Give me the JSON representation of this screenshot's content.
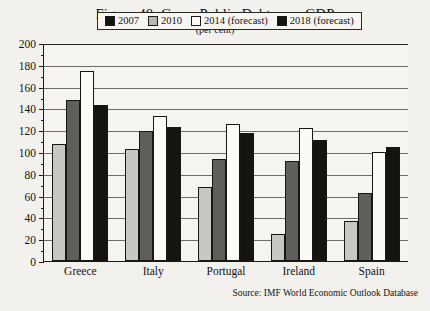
{
  "figure": {
    "title": "Figure 48. Gross Public Debt over GDP",
    "subtitle": "(per cent)",
    "source": "Source: IMF World Economic Outlook Database"
  },
  "legend": {
    "items": [
      {
        "label": "2007",
        "color": "#c9c7c2"
      },
      {
        "label": "2010",
        "color": "#5f5e5a"
      },
      {
        "label": "2014 (forecast)",
        "color": "#fbfaf7"
      },
      {
        "label": "2018 (forecast)",
        "color": "#151410"
      }
    ],
    "swatches": [
      {
        "color": "#151410"
      },
      {
        "color": "#b9b7b2"
      },
      {
        "color": "#fbfaf7"
      },
      {
        "color": "#151410"
      }
    ]
  },
  "axis": {
    "ticks": [
      "200",
      "180",
      "160",
      "140",
      "120",
      "100",
      "80",
      "60",
      "40",
      "20",
      "0"
    ],
    "min": 0,
    "max": 200,
    "step": 20
  },
  "chart_data": {
    "type": "bar",
    "title": "Figure 48. Gross Public Debt over GDP",
    "subtitle": "(per cent)",
    "xlabel": "",
    "ylabel": "per cent",
    "ylim": [
      0,
      200
    ],
    "ytick_step": 20,
    "grid": true,
    "legend_position": "top-center",
    "categories": [
      "Greece",
      "Italy",
      "Portugal",
      "Ireland",
      "Spain"
    ],
    "series": [
      {
        "name": "2007",
        "values": [
          107,
          103,
          68,
          25,
          37
        ]
      },
      {
        "name": "2010",
        "values": [
          148,
          119,
          94,
          92,
          62
        ]
      },
      {
        "name": "2014 (forecast)",
        "values": [
          174,
          133,
          126,
          122,
          100
        ]
      },
      {
        "name": "2018 (forecast)",
        "values": [
          143,
          123,
          117,
          111,
          105
        ]
      }
    ],
    "source": "Source: IMF World Economic Outlook Database"
  }
}
